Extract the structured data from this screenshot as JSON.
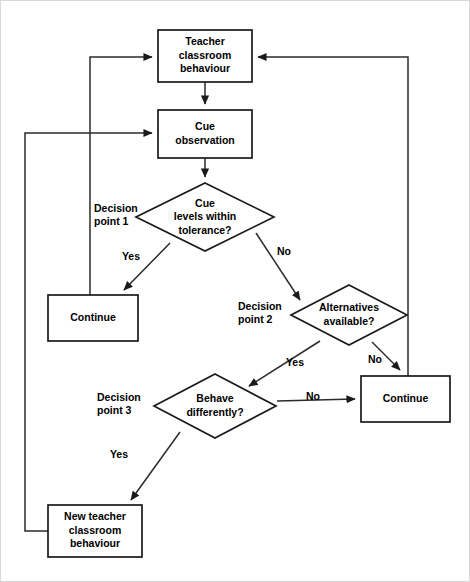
{
  "diagram": {
    "type": "flowchart",
    "canvas": {
      "width": 470,
      "height": 582
    },
    "colors": {
      "background": "#ffffff",
      "node_stroke": "#1a1a1a",
      "node_fill": "#ffffff",
      "connector": "#2b2b2b",
      "text": "#000000"
    },
    "nodes": [
      {
        "id": "teacher-behaviour",
        "shape": "rectangle",
        "lines": [
          "Teacher",
          "classroom",
          "behaviour"
        ],
        "x": 158,
        "y": 30,
        "w": 94,
        "h": 52
      },
      {
        "id": "cue-observation",
        "shape": "rectangle",
        "lines": [
          "Cue",
          "observation"
        ],
        "x": 158,
        "y": 110,
        "w": 94,
        "h": 48
      },
      {
        "id": "cue-levels-decision",
        "shape": "diamond",
        "lines": [
          "Cue",
          "levels within",
          "tolerance?"
        ],
        "cx": 205,
        "cy": 217,
        "rx": 69,
        "ry": 34
      },
      {
        "id": "continue-left",
        "shape": "rectangle",
        "lines": [
          "Continue"
        ],
        "x": 48,
        "y": 295,
        "w": 90,
        "h": 46
      },
      {
        "id": "alternatives-decision",
        "shape": "diamond",
        "lines": [
          "Alternatives",
          "available?"
        ],
        "cx": 349,
        "cy": 315,
        "rx": 58,
        "ry": 30
      },
      {
        "id": "behave-differently-decision",
        "shape": "diamond",
        "lines": [
          "Behave",
          "differently?"
        ],
        "cx": 215,
        "cy": 406,
        "rx": 61,
        "ry": 32
      },
      {
        "id": "continue-right",
        "shape": "rectangle",
        "lines": [
          "Continue"
        ],
        "x": 361,
        "y": 376,
        "w": 89,
        "h": 46
      },
      {
        "id": "new-teacher-behaviour",
        "shape": "rectangle",
        "lines": [
          "New teacher",
          "classroom",
          "behaviour"
        ],
        "x": 48,
        "y": 505,
        "w": 94,
        "h": 52
      }
    ],
    "edge_labels": [
      {
        "id": "yes-1",
        "text": "Yes",
        "x": 131,
        "y": 257
      },
      {
        "id": "no-1",
        "text": "No",
        "x": 284,
        "y": 252
      },
      {
        "id": "yes-2",
        "text": "Yes",
        "x": 295,
        "y": 363
      },
      {
        "id": "no-2",
        "text": "No",
        "x": 375,
        "y": 360
      },
      {
        "id": "no-3",
        "text": "No",
        "x": 313,
        "y": 397
      },
      {
        "id": "yes-3",
        "text": "Yes",
        "x": 119,
        "y": 455
      }
    ],
    "decision_points": [
      {
        "id": "decision-point-1",
        "lines": [
          "Decision",
          "point 1"
        ],
        "x": 94,
        "y": 209
      },
      {
        "id": "decision-point-2",
        "lines": [
          "Decision",
          "point 2"
        ],
        "x": 238,
        "y": 307
      },
      {
        "id": "decision-point-3",
        "lines": [
          "Decision",
          "point 3"
        ],
        "x": 97,
        "y": 398
      }
    ],
    "edges": [
      {
        "from": "teacher-behaviour",
        "to": "cue-observation",
        "label": ""
      },
      {
        "from": "cue-observation",
        "to": "cue-levels-decision",
        "label": ""
      },
      {
        "from": "cue-levels-decision",
        "to": "continue-left",
        "label": "Yes"
      },
      {
        "from": "cue-levels-decision",
        "to": "alternatives-decision",
        "label": "No"
      },
      {
        "from": "alternatives-decision",
        "to": "behave-differently-decision",
        "label": "Yes"
      },
      {
        "from": "alternatives-decision",
        "to": "continue-right",
        "label": "No"
      },
      {
        "from": "behave-differently-decision",
        "to": "continue-right",
        "label": "No"
      },
      {
        "from": "behave-differently-decision",
        "to": "new-teacher-behaviour",
        "label": "Yes"
      },
      {
        "from": "continue-left",
        "to": "teacher-behaviour",
        "label": ""
      },
      {
        "from": "continue-right",
        "to": "teacher-behaviour",
        "label": ""
      },
      {
        "from": "new-teacher-behaviour",
        "to": "cue-observation",
        "label": ""
      }
    ]
  }
}
